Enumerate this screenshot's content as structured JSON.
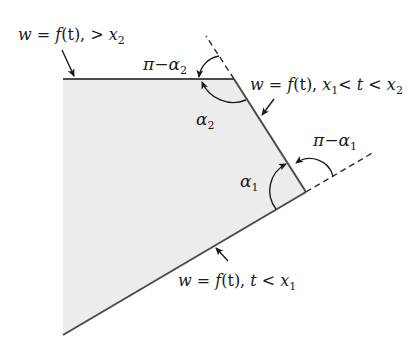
{
  "diagram": {
    "colors": {
      "fill": "#ececec",
      "edge": "#4a4a4a",
      "ink": "#1a1a1a"
    },
    "polygon": {
      "vertices": [
        [
          63,
          79
        ],
        [
          234,
          79
        ],
        [
          306,
          192
        ],
        [
          63,
          335
        ]
      ]
    },
    "labels": {
      "top_edge": {
        "w": "w",
        "eq": " = ",
        "f": "f",
        "t_paren": "(t), ",
        "t": "t",
        "gt": " > ",
        "x": "x",
        "sub": "2"
      },
      "middle_edge": {
        "w": "w",
        "eq": " = ",
        "f": "f",
        "t_paren": "(t), ",
        "x1": "x",
        "sub1": "1",
        "lt1": "< ",
        "t": "t",
        "lt2": " < ",
        "x2": "x",
        "sub2": "2"
      },
      "bottom_edge": {
        "w": "w",
        "eq": " = ",
        "f": "f",
        "t_paren": "(t), ",
        "t": "t",
        "lt": " < ",
        "x": "x",
        "sub": "1"
      },
      "pi_minus_alpha2": {
        "pi": "π",
        "minus": "−",
        "alpha": "α",
        "sub": "2"
      },
      "alpha2": {
        "alpha": "α",
        "sub": "2"
      },
      "pi_minus_alpha1": {
        "pi": "π",
        "minus": "−",
        "alpha": "α",
        "sub": "1"
      },
      "alpha1": {
        "alpha": "α",
        "sub": "1"
      }
    }
  }
}
